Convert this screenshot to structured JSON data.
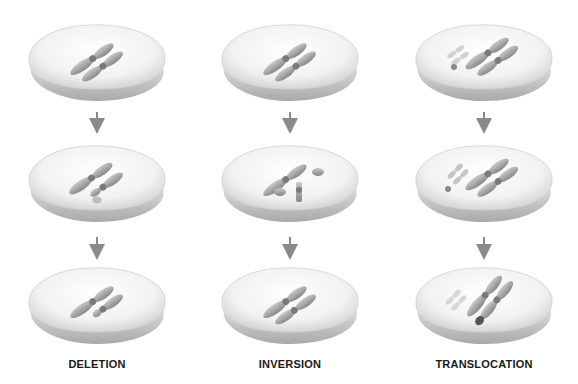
{
  "diagram": {
    "type": "chromosome-mutation-stages",
    "columns": [
      {
        "label": "DELETION",
        "center_x": 97,
        "stages": [
          {
            "step": 1,
            "description": "intact homologous chromosome pair"
          },
          {
            "step": 2,
            "description": "segment breaks off from one chromosome"
          },
          {
            "step": 3,
            "description": "chromosome lacking deleted segment"
          }
        ]
      },
      {
        "label": "INVERSION",
        "center_x": 290,
        "stages": [
          {
            "step": 1,
            "description": "intact homologous chromosome pair"
          },
          {
            "step": 2,
            "description": "chromosome breaks; middle segment flips"
          },
          {
            "step": 3,
            "description": "chromosome rejoined with inverted segment"
          }
        ]
      },
      {
        "label": "TRANSLOCATION",
        "center_x": 484,
        "stages": [
          {
            "step": 1,
            "description": "two non-homologous chromosome pairs"
          },
          {
            "step": 2,
            "description": "segment breaks off small chromosome"
          },
          {
            "step": 3,
            "description": "segment attached to large chromosome"
          }
        ]
      }
    ],
    "colors": {
      "disc_top": "#f4f4f4",
      "disc_edge": "#c8c8c8",
      "chromosome": "#9a9a9a",
      "chromosome_faint": "#c4c4c4",
      "translocated_segment": "#555555",
      "arrow": "#8a8a8a",
      "label": "#1a1a1a"
    }
  }
}
